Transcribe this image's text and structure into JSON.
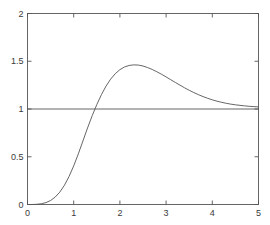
{
  "chart_data": {
    "type": "line",
    "title": "",
    "subtitle": "",
    "xlabel": "",
    "ylabel": "",
    "xlim": [
      0,
      5
    ],
    "ylim": [
      0,
      2
    ],
    "xticks": [
      0,
      1,
      2,
      3,
      4,
      5
    ],
    "yticks": [
      0,
      0.5,
      1,
      1.5,
      2
    ],
    "xtick_labels": [
      "0",
      "1",
      "2",
      "3",
      "4",
      "5"
    ],
    "ytick_labels": [
      "0",
      "0.5",
      "1",
      "1.5",
      "2"
    ],
    "grid": false,
    "legend": null,
    "legend_position": "none",
    "box": true,
    "tick_direction": "in",
    "series": [
      {
        "name": "reference-line",
        "style": "solid",
        "color": "#555555",
        "linewidth": 0.9,
        "x": [
          0,
          5
        ],
        "values": [
          1,
          1
        ]
      },
      {
        "name": "response-curve",
        "style": "solid",
        "color": "#555555",
        "linewidth": 0.9,
        "x": [
          0,
          0.1,
          0.2,
          0.3,
          0.4,
          0.5,
          0.6,
          0.7,
          0.8,
          0.9,
          1.0,
          1.1,
          1.2,
          1.3,
          1.4,
          1.5,
          1.6,
          1.7,
          1.8,
          1.9,
          2.0,
          2.1,
          2.2,
          2.3,
          2.4,
          2.5,
          2.6,
          2.7,
          2.8,
          2.9,
          3.0,
          3.1,
          3.2,
          3.3,
          3.4,
          3.5,
          3.6,
          3.7,
          3.8,
          3.9,
          4.0,
          4.1,
          4.2,
          4.3,
          4.4,
          4.5,
          4.6,
          4.7,
          4.8,
          4.9,
          5.0
        ],
        "values": [
          0.0,
          0.0,
          0.002,
          0.008,
          0.02,
          0.042,
          0.078,
          0.13,
          0.202,
          0.294,
          0.404,
          0.53,
          0.666,
          0.802,
          0.93,
          1.046,
          1.15,
          1.24,
          1.313,
          1.37,
          1.412,
          1.44,
          1.456,
          1.462,
          1.46,
          1.45,
          1.434,
          1.414,
          1.39,
          1.364,
          1.336,
          1.307,
          1.278,
          1.25,
          1.222,
          1.196,
          1.172,
          1.15,
          1.13,
          1.112,
          1.096,
          1.082,
          1.07,
          1.06,
          1.051,
          1.044,
          1.038,
          1.033,
          1.028,
          1.025,
          1.022
        ]
      }
    ],
    "annotations": {
      "peak_value": 1.48,
      "peak_x": 2.0,
      "asymptote": 1.0,
      "crossing_x": 1.26
    }
  },
  "axes": {
    "background": "#ffffff",
    "line_color": "#555555"
  }
}
